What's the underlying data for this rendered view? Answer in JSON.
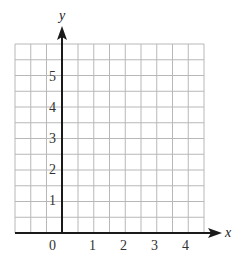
{
  "diagram": {
    "type": "coordinate-grid",
    "axes": {
      "x_label": "x",
      "y_label": "y",
      "x_ticks": [
        "0",
        "1",
        "2",
        "3",
        "4"
      ],
      "y_ticks": [
        "1",
        "2",
        "3",
        "4",
        "5"
      ]
    },
    "grid": {
      "cell_units": 0.5,
      "x_range": [
        -1.5,
        4.5
      ],
      "y_range": [
        0,
        6
      ]
    },
    "colors": {
      "grid_line": "#b8b8b8",
      "axis_line": "#1a1a1a",
      "label": "#333333"
    }
  }
}
